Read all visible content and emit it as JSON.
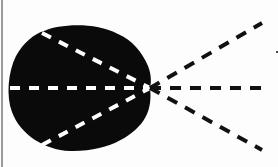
{
  "diagram": {
    "type": "ray-divergence",
    "colors": {
      "background": "#fdfdfd",
      "body_fill": "#0a0a0a",
      "inner_ray": "#ffffff",
      "outer_ray": "#111111",
      "edge_line": "#9a9a9a"
    },
    "focal_point": {
      "x": 150,
      "y": 88
    },
    "body_path": "M 44 31 C 60 24, 95 22, 118 34 C 132 40, 142 52, 148 66 C 152 76, 151 84, 150 88 C 151 96, 151 108, 145 118 C 136 134, 110 152, 70 151 C 44 150, 20 134, 12 112 C 6 96, 8 72, 16 56 C 24 42, 34 34, 44 31 Z",
    "inner_rays": [
      {
        "name": "upper",
        "x1": 42,
        "y1": 33,
        "x2": 150,
        "y2": 88
      },
      {
        "name": "middle",
        "x1": 10,
        "y1": 88,
        "x2": 150,
        "y2": 88
      },
      {
        "name": "lower",
        "x1": 42,
        "y1": 145,
        "x2": 150,
        "y2": 88
      }
    ],
    "outer_rays": [
      {
        "name": "upper",
        "x1": 150,
        "y1": 88,
        "x2": 262,
        "y2": 23
      },
      {
        "name": "middle",
        "x1": 150,
        "y1": 88,
        "x2": 270,
        "y2": 88
      },
      {
        "name": "lower",
        "x1": 150,
        "y1": 88,
        "x2": 262,
        "y2": 150
      }
    ],
    "marker_dot": {
      "x": 277,
      "y": 52,
      "r": 1
    }
  }
}
